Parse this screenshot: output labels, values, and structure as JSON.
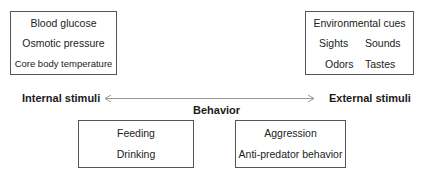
{
  "diagram": {
    "internal_box": {
      "lines": [
        "Blood glucose",
        "Osmotic pressure",
        "Core body temperature"
      ]
    },
    "external_box": {
      "title": "Environmental cues",
      "row1": [
        "Sights",
        "Sounds"
      ],
      "row2": [
        "Odors",
        "Tastes"
      ]
    },
    "axis": {
      "left_label": "Internal stimuli",
      "right_label": "External stimuli",
      "center_label": "Behavior",
      "arrow": "double-headed"
    },
    "behavior_boxes": [
      {
        "lines": [
          "Feeding",
          "Drinking"
        ]
      },
      {
        "lines": [
          "Aggression",
          "Anti-predator behavior"
        ]
      }
    ],
    "colors": {
      "border": "#555555",
      "arrow": "#888888",
      "text": "#222222"
    }
  }
}
